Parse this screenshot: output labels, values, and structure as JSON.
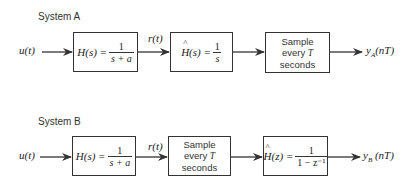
{
  "system_a": {
    "title": "System A",
    "input": "u(t)",
    "intermediate": "r(t)",
    "blocks": [
      {
        "lhs": "H(s) =",
        "num": "1",
        "den": "s + a"
      },
      {
        "lhs": "H(s) =",
        "num": "1",
        "den": "s"
      },
      {
        "line1": "Sample",
        "line2_pre": "every ",
        "line2_var": "T",
        "line3": "seconds"
      }
    ],
    "output_main": "y",
    "output_sub": "A",
    "output_arg": "(nT)"
  },
  "system_b": {
    "title": "System B",
    "input": "u(t)",
    "intermediate": "r(t)",
    "blocks": [
      {
        "lhs": "H(s) =",
        "num": "1",
        "den": "s + a"
      },
      {
        "line1": "Sample",
        "line2_pre": "every ",
        "line2_var": "T",
        "line3": "seconds"
      },
      {
        "lhs": "H(z) =",
        "num": "1",
        "den": "1 − z⁻¹"
      }
    ],
    "output_main": "y",
    "output_sub": "B",
    "output_arg": " (nT)"
  },
  "colors": {
    "line": "#333333",
    "text": "#222222"
  }
}
